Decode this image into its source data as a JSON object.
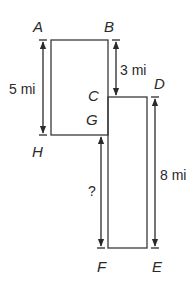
{
  "diagram": {
    "points": {
      "A": "A",
      "B": "B",
      "C": "C",
      "D": "D",
      "E": "E",
      "F": "F",
      "G": "G",
      "H": "H"
    },
    "rectangles": [
      {
        "name": "ABHG",
        "vertices": [
          "A",
          "B",
          "G",
          "H"
        ]
      },
      {
        "name": "CDEF",
        "vertices": [
          "C",
          "D",
          "E",
          "F"
        ]
      }
    ],
    "dimensions": {
      "left_height": {
        "label": "5 mi",
        "from": "A",
        "to": "H",
        "value": 5,
        "unit": "mi"
      },
      "BC": {
        "label": "3 mi",
        "from": "B",
        "to": "C",
        "value": 3,
        "unit": "mi"
      },
      "right_height": {
        "label": "8 mi",
        "from": "D",
        "to": "E",
        "value": 8,
        "unit": "mi"
      },
      "unknown": {
        "label": "?",
        "from": "G",
        "to": "F"
      }
    },
    "colors": {
      "stroke": "#3a3a3a",
      "text": "#2a2a2a",
      "background": "#ffffff"
    }
  }
}
